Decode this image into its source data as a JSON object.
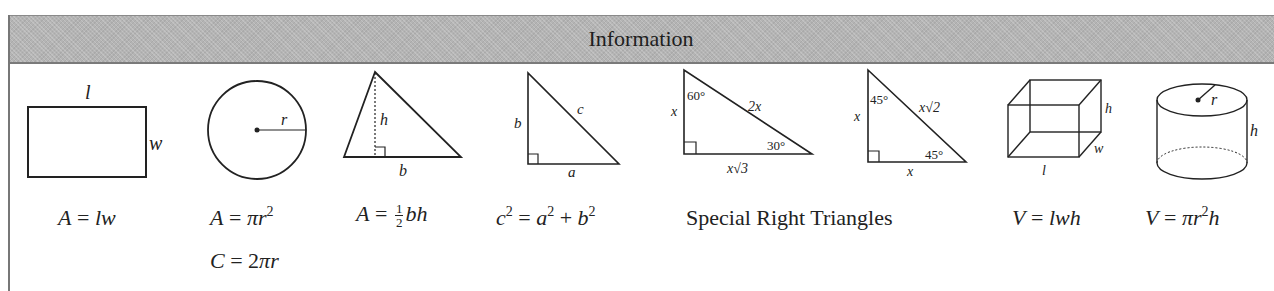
{
  "header": {
    "title": "Information"
  },
  "figures": {
    "rectangle": {
      "labels": {
        "length": "l",
        "width": "w"
      }
    },
    "circle": {
      "labels": {
        "radius": "r"
      }
    },
    "triangle": {
      "labels": {
        "height": "h",
        "base": "b"
      }
    },
    "right_triangle": {
      "labels": {
        "leg_vertical": "b",
        "hypotenuse": "c",
        "leg_horizontal": "a"
      }
    },
    "triangle_30_60_90": {
      "labels": {
        "short_leg": "x",
        "hypotenuse": "2x",
        "long_leg": "x√3",
        "top_angle": "60°",
        "bottom_angle": "30°"
      }
    },
    "triangle_45_45_90": {
      "labels": {
        "leg_vertical": "x",
        "hypotenuse": "x√2",
        "leg_horizontal": "x",
        "top_angle": "45°",
        "bottom_angle": "45°"
      }
    },
    "box": {
      "labels": {
        "height": "h",
        "width": "w",
        "length": "l"
      }
    },
    "cylinder": {
      "labels": {
        "radius": "r",
        "height": "h"
      }
    }
  },
  "formulas": {
    "rectangle_area": {
      "lhs": "A",
      "eq": " = ",
      "rhs": "lw"
    },
    "circle_area": {
      "lhs": "A",
      "eq": " = ",
      "pi": "π",
      "var": "r",
      "exp": "2"
    },
    "circle_circumference": {
      "lhs": "C",
      "eq": " = ",
      "coef": "2",
      "pi": "π",
      "var": "r"
    },
    "triangle_area": {
      "lhs": "A",
      "eq": " = ",
      "num": "1",
      "den": "2",
      "rhs": "bh"
    },
    "pythagorean": {
      "c": "c",
      "exp": "2",
      "eq": " = ",
      "a": "a",
      "plus": " + ",
      "b": "b"
    },
    "special_right_triangles": {
      "label": "Special Right Triangles"
    },
    "box_volume": {
      "lhs": "V",
      "eq": " = ",
      "rhs": "lwh"
    },
    "cylinder_volume": {
      "lhs": "V",
      "eq": " = ",
      "pi": "π",
      "var": "r",
      "exp": "2",
      "h": "h"
    }
  }
}
